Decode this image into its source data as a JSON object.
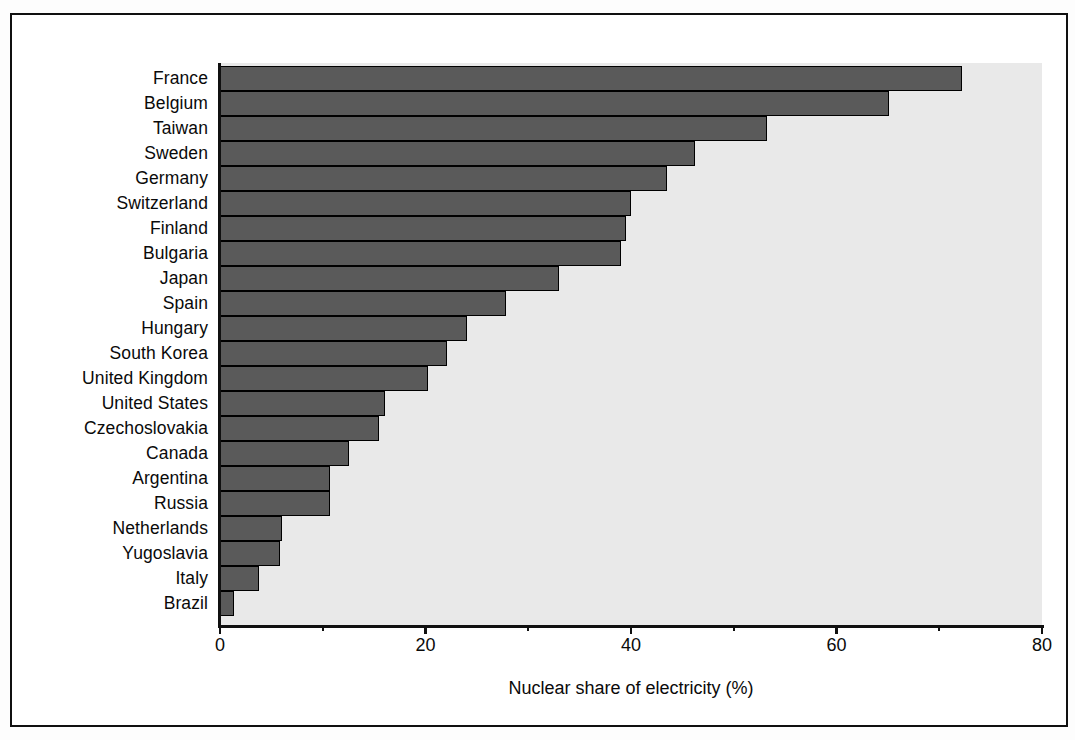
{
  "figure": {
    "frame_color": "#101010",
    "background_color": "#ffffff"
  },
  "chart_data": {
    "type": "bar",
    "orientation": "horizontal",
    "title": "",
    "subtitle": "",
    "xlabel": "Nuclear share of electricity (%)",
    "ylabel": "",
    "xlim": [
      0,
      80
    ],
    "xticks": [
      0,
      20,
      40,
      60,
      80
    ],
    "xtick_labels": [
      "0",
      "20",
      "40",
      "60",
      "80"
    ],
    "minor_tick_interval": 10,
    "grid": false,
    "legend": null,
    "bar_color": "#5a5a5a",
    "bar_edge_color": "#000000",
    "plot_background": "#e9e9e9",
    "categories": [
      "France",
      "Belgium",
      "Taiwan",
      "Sweden",
      "Germany",
      "Switzerland",
      "Finland",
      "Bulgaria",
      "Japan",
      "Spain",
      "Hungary",
      "South Korea",
      "United Kingdom",
      "United States",
      "Czechoslovakia",
      "Canada",
      "Argentina",
      "Russia",
      "Netherlands",
      "Yugoslavia",
      "Italy",
      "Brazil"
    ],
    "values": [
      72.2,
      65.1,
      53.2,
      46.2,
      43.5,
      40.0,
      39.5,
      39.0,
      33.0,
      27.8,
      24.0,
      22.1,
      20.2,
      16.1,
      15.5,
      12.6,
      10.7,
      10.7,
      6.0,
      5.8,
      3.8,
      1.4
    ]
  }
}
